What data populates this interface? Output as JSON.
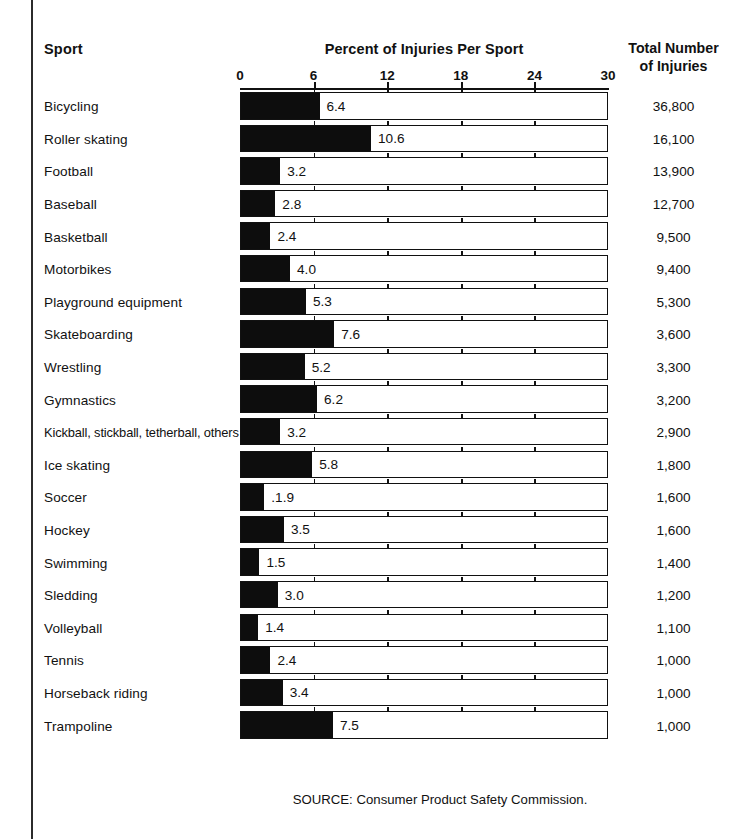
{
  "page": {
    "source_note": "SOURCE: Consumer Product Safety Commission."
  },
  "header": {
    "sport_label": "Sport",
    "percent_label": "Percent of Injuries Per Sport",
    "total_label_line1": "Total Number",
    "total_label_line2": "of Injuries"
  },
  "chart_data": {
    "type": "bar",
    "orientation": "horizontal",
    "title": "Percent of Injuries Per Sport",
    "xlabel": "",
    "ylabel": "Sport",
    "xlim": [
      0,
      30
    ],
    "xticks": [
      0,
      6,
      12,
      18,
      24,
      30
    ],
    "xtick_labels": [
      "0",
      "6",
      "12",
      "18",
      "24",
      "30"
    ],
    "grid": false,
    "legend": "none",
    "categories": [
      "Bicycling",
      "Roller skating",
      "Football",
      "Baseball",
      "Basketball",
      "Motorbikes",
      "Playground equipment",
      "Skateboarding",
      "Wrestling",
      "Gymnastics",
      "Kickball, stickball, tetherball, others",
      "Ice skating",
      "Soccer",
      "Hockey",
      "Swimming",
      "Sledding",
      "Volleyball",
      "Tennis",
      "Horseback riding",
      "Trampoline"
    ],
    "values": [
      6.4,
      10.6,
      3.2,
      2.8,
      2.4,
      4.0,
      5.3,
      7.6,
      5.2,
      6.2,
      3.2,
      5.8,
      1.9,
      3.5,
      1.5,
      3.0,
      1.4,
      2.4,
      3.4,
      7.5
    ],
    "value_labels": [
      "6.4",
      "10.6",
      "3.2",
      "2.8",
      "2.4",
      "4.0",
      "5.3",
      "7.6",
      "5.2",
      "6.2",
      "3.2",
      "5.8",
      ".1.9",
      "3.5",
      "1.5",
      "3.0",
      "1.4",
      "2.4",
      "3.4",
      "7.5"
    ],
    "secondary_series": {
      "name": "Total Number of Injuries",
      "values": [
        36800,
        16100,
        13900,
        12700,
        9500,
        9400,
        5300,
        3600,
        3300,
        3200,
        2900,
        1800,
        1600,
        1600,
        1400,
        1200,
        1100,
        1000,
        1000,
        1000
      ],
      "value_labels": [
        "36,800",
        "16,100",
        "13,900",
        "12,700",
        "9,500",
        "9,400",
        "5,300",
        "3,600",
        "3,300",
        "3,200",
        "2,900",
        "1,800",
        "1,600",
        "1,600",
        "1,400",
        "1,200",
        "1,100",
        "1,000",
        "1,000",
        "1,000"
      ]
    },
    "colors": {
      "bar_fill": "#0d0d0d",
      "bar_track": "#ffffff",
      "bar_border": "#111111",
      "text": "#111111"
    }
  }
}
